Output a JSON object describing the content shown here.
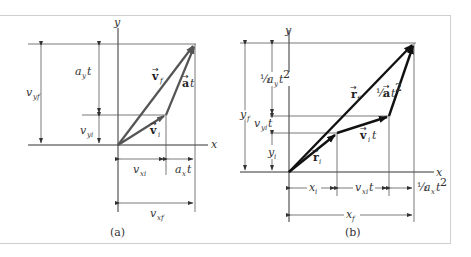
{
  "figure": {
    "panels": [
      {
        "id": "a",
        "caption": "(a)",
        "axes": {
          "x_label": "x",
          "y_label": "y"
        },
        "vectors": {
          "v_i": {
            "symbol": "v",
            "subscript": "i",
            "label": "v⃗ᵢ"
          },
          "v_f": {
            "symbol": "v",
            "subscript": "f",
            "label": "v⃗_f"
          },
          "at": {
            "symbol": "a",
            "suffix": "t",
            "label": "a⃗t"
          }
        },
        "dimensions": {
          "vertical": [
            {
              "base": "v",
              "sub": "yf"
            },
            {
              "base": "a",
              "sub": "y",
              "suffix": "t"
            },
            {
              "base": "v",
              "sub": "yi"
            }
          ],
          "horizontal": [
            {
              "base": "v",
              "sub": "xi"
            },
            {
              "base": "a",
              "sub": "x",
              "suffix": "t"
            },
            {
              "base": "v",
              "sub": "xf"
            }
          ]
        }
      },
      {
        "id": "b",
        "caption": "(b)",
        "axes": {
          "x_label": "x",
          "y_label": "y"
        },
        "vectors": {
          "r_i": {
            "symbol": "r",
            "subscript": "i"
          },
          "r_f": {
            "symbol": "r",
            "subscript": "f"
          },
          "v_i_t": {
            "symbol": "v",
            "subscript": "i",
            "suffix": "t"
          },
          "half_at2": {
            "prefix": "½",
            "symbol": "a",
            "suffix": "t²"
          }
        },
        "dimensions": {
          "vertical": [
            {
              "base": "y",
              "sub": "f"
            },
            {
              "prefix": "½",
              "base": "a",
              "sub": "y",
              "suffix": "t²"
            },
            {
              "base": "v",
              "sub": "yi",
              "suffix": "t"
            },
            {
              "base": "y",
              "sub": "i"
            }
          ],
          "horizontal": [
            {
              "base": "x",
              "sub": "i"
            },
            {
              "base": "v",
              "sub": "xi",
              "suffix": "t"
            },
            {
              "prefix": "½",
              "base": "a",
              "sub": "x",
              "suffix": "t²"
            },
            {
              "base": "x",
              "sub": "f"
            }
          ]
        }
      }
    ],
    "colors": {
      "panel_a_vectors": "#555555",
      "panel_b_vectors": "#111111",
      "frame": "#cfcfcf"
    }
  }
}
